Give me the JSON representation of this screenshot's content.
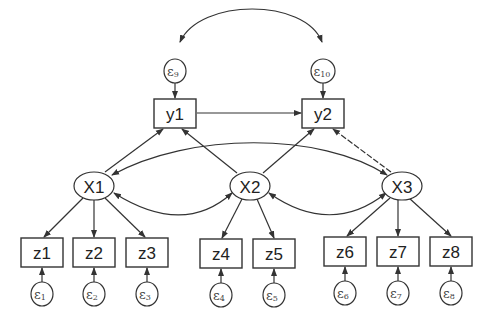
{
  "diagram": {
    "type": "structural-equation-model",
    "latent": [
      {
        "id": "X1",
        "label": "X1",
        "cx": 94,
        "cy": 186
      },
      {
        "id": "X2",
        "label": "X2",
        "cx": 250,
        "cy": 186
      },
      {
        "id": "X3",
        "label": "X3",
        "cx": 402,
        "cy": 186
      }
    ],
    "observed_y": [
      {
        "id": "y1",
        "label": "y1",
        "x": 154,
        "y": 99,
        "w": 42,
        "h": 29
      },
      {
        "id": "y2",
        "label": "y2",
        "x": 302,
        "y": 99,
        "w": 42,
        "h": 29
      }
    ],
    "observed_z": [
      {
        "id": "z1",
        "label": "z1",
        "x": 21,
        "y": 238
      },
      {
        "id": "z2",
        "label": "z2",
        "x": 73,
        "y": 238
      },
      {
        "id": "z3",
        "label": "z3",
        "x": 126,
        "y": 238
      },
      {
        "id": "z4",
        "label": "z4",
        "x": 200,
        "y": 239
      },
      {
        "id": "z5",
        "label": "z5",
        "x": 253,
        "y": 239
      },
      {
        "id": "z6",
        "label": "z6",
        "x": 324,
        "y": 237
      },
      {
        "id": "z7",
        "label": "z7",
        "x": 377,
        "y": 237
      },
      {
        "id": "z8",
        "label": "z8",
        "x": 430,
        "y": 237
      }
    ],
    "errors": [
      {
        "id": "e1",
        "symbol": "ε",
        "sub": "1",
        "target": "z1"
      },
      {
        "id": "e2",
        "symbol": "ε",
        "sub": "2",
        "target": "z2"
      },
      {
        "id": "e3",
        "symbol": "ε",
        "sub": "3",
        "target": "z3"
      },
      {
        "id": "e4",
        "symbol": "ε",
        "sub": "4",
        "target": "z4"
      },
      {
        "id": "e5",
        "symbol": "ε",
        "sub": "5",
        "target": "z5"
      },
      {
        "id": "e6",
        "symbol": "ε",
        "sub": "6",
        "target": "z6"
      },
      {
        "id": "e7",
        "symbol": "ε",
        "sub": "7",
        "target": "z7"
      },
      {
        "id": "e8",
        "symbol": "ε",
        "sub": "8",
        "target": "z8"
      },
      {
        "id": "e9",
        "symbol": "ε",
        "sub": "9",
        "target": "y1"
      },
      {
        "id": "e10",
        "symbol": "ε",
        "sub": "10",
        "target": "y2"
      }
    ],
    "paths": [
      {
        "from": "X1",
        "to": "y1"
      },
      {
        "from": "X2",
        "to": "y1"
      },
      {
        "from": "X2",
        "to": "y2"
      },
      {
        "from": "X3",
        "to": "y2"
      },
      {
        "from": "y1",
        "to": "y2"
      },
      {
        "from": "X1",
        "to": "z1"
      },
      {
        "from": "X1",
        "to": "z2"
      },
      {
        "from": "X1",
        "to": "z3"
      },
      {
        "from": "X2",
        "to": "z4"
      },
      {
        "from": "X2",
        "to": "z5"
      },
      {
        "from": "X3",
        "to": "z6"
      },
      {
        "from": "X3",
        "to": "z7"
      },
      {
        "from": "X3",
        "to": "z8"
      }
    ],
    "covariances": [
      {
        "between": [
          "X1",
          "X2"
        ]
      },
      {
        "between": [
          "X2",
          "X3"
        ]
      },
      {
        "between": [
          "X1",
          "X3"
        ]
      },
      {
        "between": [
          "e9",
          "e10"
        ]
      }
    ]
  }
}
